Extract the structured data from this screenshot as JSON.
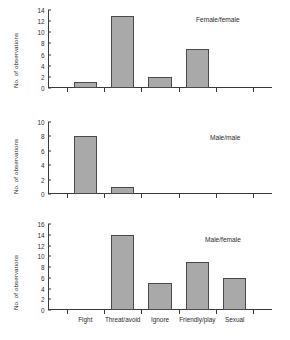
{
  "chart_data": {
    "type": "bar",
    "title": "",
    "xlabel": "",
    "ylabel": "No. of observations",
    "grid": false,
    "legend": "none",
    "categories": [
      "Fight",
      "Threat/avoid",
      "Ignore",
      "Friendly/play",
      "Sexual"
    ],
    "panels": [
      {
        "label": "Female/female",
        "values": [
          1,
          13,
          2,
          7,
          0
        ],
        "ylim": [
          0,
          14
        ],
        "yticks": [
          0,
          2,
          4,
          6,
          8,
          10,
          12,
          14
        ],
        "ylabel": "No. of observations",
        "show_xlabels": false
      },
      {
        "label": "Male/male",
        "values": [
          8,
          1,
          0,
          0,
          0
        ],
        "ylim": [
          0,
          10
        ],
        "yticks": [
          0,
          2,
          4,
          6,
          8,
          10
        ],
        "ylabel": "No. of observations",
        "show_xlabels": false
      },
      {
        "label": "Male/female",
        "values": [
          0,
          14,
          5,
          9,
          6
        ],
        "ylim": [
          0,
          16
        ],
        "yticks": [
          0,
          2,
          4,
          6,
          8,
          10,
          12,
          14,
          16
        ],
        "ylabel": "No. of observations",
        "show_xlabels": true
      }
    ],
    "style": {
      "bar_fill": "#a9a9a9",
      "bar_edge": "#4a4a4a",
      "axis_color": "#3a3a3a",
      "text_color": "#2b2b2b",
      "background": "#ffffff"
    }
  }
}
